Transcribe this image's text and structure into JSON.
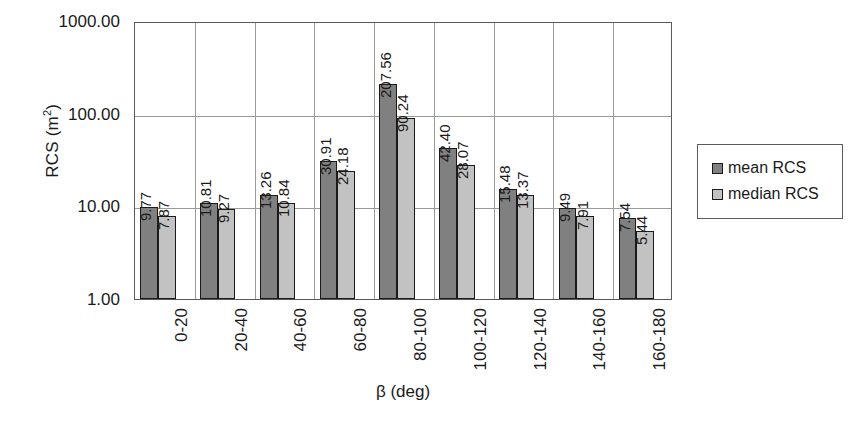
{
  "chart_data": {
    "type": "bar",
    "title": "",
    "xlabel": "β (deg)",
    "ylabel": "RCS (m²)",
    "yscale": "log",
    "ylim": [
      1,
      1000
    ],
    "ytick_labels": [
      "1.00",
      "10.00",
      "100.00",
      "1000.00"
    ],
    "ytick_values": [
      1,
      10,
      100,
      1000
    ],
    "grid": "major-horizontal-and-category-vertical",
    "legend_position": "right",
    "categories": [
      "0-20",
      "20-40",
      "40-60",
      "60-80",
      "80-100",
      "100-120",
      "120-140",
      "140-160",
      "160-180"
    ],
    "series": [
      {
        "name": "mean RCS",
        "color": "#808080",
        "values": [
          9.77,
          10.81,
          13.26,
          30.91,
          207.56,
          42.4,
          15.48,
          9.49,
          7.54
        ],
        "labels": [
          "9.77",
          "10.81",
          "13.26",
          "30.91",
          "207.56",
          "42.40",
          "15.48",
          "9.49",
          "7.54"
        ]
      },
      {
        "name": "median RCS",
        "color": "#c2c2c2",
        "values": [
          7.87,
          9.27,
          10.84,
          24.18,
          90.24,
          28.07,
          13.37,
          7.91,
          5.44
        ],
        "labels": [
          "7.87",
          "9.27",
          "10.84",
          "24.18",
          "90.24",
          "28.07",
          "13.37",
          "7.91",
          "5.44"
        ]
      }
    ]
  },
  "legend": {
    "items": [
      {
        "label": "mean RCS",
        "color": "#808080"
      },
      {
        "label": "median RCS",
        "color": "#c2c2c2"
      }
    ]
  },
  "axes": {
    "y_title_main": "RCS (m",
    "y_title_sup": "2",
    "y_title_close": ")",
    "x_title": "β (deg)"
  }
}
